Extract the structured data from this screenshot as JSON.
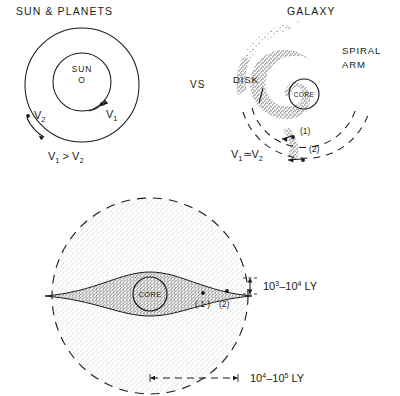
{
  "figure": {
    "left_panel": {
      "title": "SUN & PLANETS",
      "center_label": "SUN",
      "center_symbol": "O",
      "inner_velocity": "V",
      "inner_velocity_sub": "1",
      "outer_velocity": "V",
      "outer_velocity_sub": "2",
      "relation": "V₁ > V₂",
      "relation_parts": {
        "v_a": "V",
        "sub_a": "1",
        "operator": ">",
        "v_b": "V",
        "sub_b": "2"
      }
    },
    "separator": {
      "label": "VS"
    },
    "right_panel": {
      "title": "GALAXY",
      "spiral_arm_label_line1": "SPIRAL",
      "spiral_arm_label_line2": "ARM",
      "disk_label": "DISK",
      "core_label": "CORE",
      "marker_1": "(1)",
      "marker_2": "(2)",
      "relation_parts": {
        "v_a": "V",
        "sub_a": "1",
        "operator": "≃",
        "v_b": "V",
        "sub_b": "2"
      }
    },
    "bottom_panel": {
      "core_label": "CORE",
      "marker_1": "( 1 )",
      "marker_2": "(2)",
      "vertical_dimension": {
        "base": "10",
        "exp_low": "3",
        "dash": "–",
        "base2": "10",
        "exp_high": "4",
        "unit": "LY",
        "full": "10³–10⁴ LY"
      },
      "horizontal_dimension": {
        "base": "10",
        "exp_low": "4",
        "dash": "–",
        "base2": "10",
        "exp_high": "5",
        "unit": "LY",
        "full": "10⁴–10⁵ LY"
      }
    }
  },
  "style": {
    "ink": "#1a1a1a",
    "stipple_light": "#cfcfcf",
    "stipple_medium": "#6e6e6e",
    "background": "#ffffff"
  }
}
